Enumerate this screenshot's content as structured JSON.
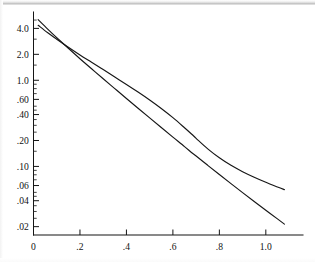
{
  "chart_data": {
    "type": "line",
    "title": "",
    "subtitle": "",
    "xlabel": "",
    "ylabel": "",
    "yscale": "log",
    "xscale": "linear",
    "grid": false,
    "legend": null,
    "xlim": [
      0,
      1.16
    ],
    "ylim": [
      0.016,
      6.2
    ],
    "x_ticks": [
      {
        "value": 0,
        "label": "0"
      },
      {
        "value": 0.2,
        "label": ".2"
      },
      {
        "value": 0.4,
        "label": ".4"
      },
      {
        "value": 0.6,
        "label": ".6"
      },
      {
        "value": 0.8,
        "label": ".8"
      },
      {
        "value": 1.0,
        "label": "1.0"
      }
    ],
    "y_ticks": [
      {
        "value": 4.0,
        "label": "4.0"
      },
      {
        "value": 2.0,
        "label": "2.0"
      },
      {
        "value": 1.0,
        "label": "1.0"
      },
      {
        "value": 0.6,
        "label": ".60"
      },
      {
        "value": 0.4,
        "label": ".40"
      },
      {
        "value": 0.2,
        "label": ".20"
      },
      {
        "value": 0.1,
        "label": ".10"
      },
      {
        "value": 0.06,
        "label": ".06"
      },
      {
        "value": 0.04,
        "label": ".04"
      },
      {
        "value": 0.02,
        "label": ".02"
      }
    ],
    "y_minor_ticks": [
      5.0,
      3.0,
      1.5,
      0.9,
      0.8,
      0.7,
      0.5,
      0.45,
      0.35,
      0.3,
      0.25,
      0.15,
      0.09,
      0.08,
      0.07,
      0.05,
      0.045,
      0.035,
      0.03,
      0.025
    ],
    "series": [
      {
        "name": "straight-line",
        "style": "solid",
        "color": "#161616",
        "points": [
          [
            0.02,
            5.05
          ],
          [
            0.06,
            3.95
          ],
          [
            0.1,
            3.12
          ],
          [
            0.15,
            2.35
          ],
          [
            0.2,
            1.78
          ],
          [
            0.25,
            1.36
          ],
          [
            0.3,
            1.04
          ],
          [
            0.35,
            0.8
          ],
          [
            0.4,
            0.615
          ],
          [
            0.45,
            0.474
          ],
          [
            0.5,
            0.366
          ],
          [
            0.55,
            0.283
          ],
          [
            0.6,
            0.219
          ],
          [
            0.65,
            0.17
          ],
          [
            0.68,
            0.145
          ],
          [
            0.7,
            0.132
          ],
          [
            0.75,
            0.103
          ],
          [
            0.8,
            0.0805
          ],
          [
            0.85,
            0.0632
          ],
          [
            0.9,
            0.0497
          ],
          [
            0.95,
            0.0392
          ],
          [
            1.0,
            0.031
          ],
          [
            1.05,
            0.0246
          ],
          [
            1.08,
            0.0214
          ]
        ]
      },
      {
        "name": "curved-line",
        "style": "solid",
        "color": "#161616",
        "points": [
          [
            0.02,
            4.35
          ],
          [
            0.06,
            3.58
          ],
          [
            0.1,
            3.0
          ],
          [
            0.15,
            2.42
          ],
          [
            0.2,
            1.97
          ],
          [
            0.25,
            1.62
          ],
          [
            0.3,
            1.33
          ],
          [
            0.35,
            1.09
          ],
          [
            0.4,
            0.895
          ],
          [
            0.45,
            0.73
          ],
          [
            0.5,
            0.59
          ],
          [
            0.55,
            0.47
          ],
          [
            0.6,
            0.368
          ],
          [
            0.65,
            0.281
          ],
          [
            0.68,
            0.238
          ],
          [
            0.7,
            0.212
          ],
          [
            0.75,
            0.16
          ],
          [
            0.8,
            0.126
          ],
          [
            0.85,
            0.103
          ],
          [
            0.9,
            0.087
          ],
          [
            0.95,
            0.075
          ],
          [
            1.0,
            0.0655
          ],
          [
            1.05,
            0.0578
          ],
          [
            1.08,
            0.0538
          ]
        ]
      }
    ]
  }
}
